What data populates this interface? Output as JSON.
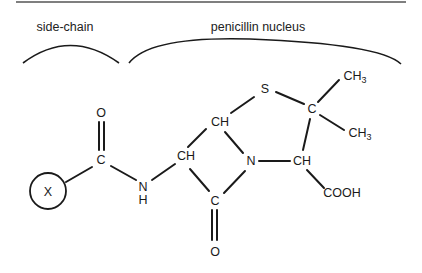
{
  "diagram": {
    "type": "chemical-structure",
    "colors": {
      "ink": "#1a1a1a",
      "rule": "#555555",
      "background": "#ffffff"
    },
    "captions": {
      "side_chain": "side-chain",
      "nucleus": "penicillin nucleus"
    },
    "atoms": {
      "x_group": "X",
      "carbonyl_o_top": "O",
      "amide_c": "C",
      "amide_n": "N",
      "amide_h": "H",
      "alpha_ch": "CH",
      "ring_ch_top": "CH",
      "sulfur": "S",
      "gem_c": "C",
      "ch3_upper_main": "CH",
      "ch3_upper_sub": "3",
      "ch3_lower_main": "CH",
      "ch3_lower_sub": "3",
      "ring_n": "N",
      "ring_ch_right": "CH",
      "carboxyl": "COOH",
      "lactam_c": "C",
      "lactam_o": "O"
    }
  }
}
